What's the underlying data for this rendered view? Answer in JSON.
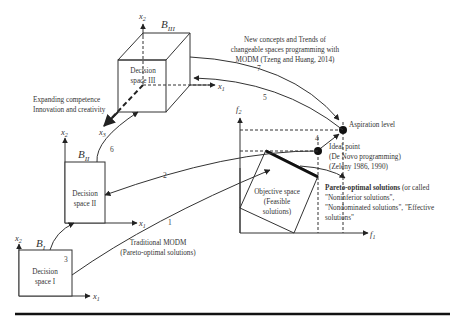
{
  "decision_spaces": {
    "space1": {
      "label_line1": "Decision",
      "label_line2": "space I",
      "b_label": "B",
      "b_sub": "I"
    },
    "space2": {
      "label_line1": "Decision",
      "label_line2": "space II",
      "b_label": "B",
      "b_sub": "II"
    },
    "space3": {
      "label_line1": "Decision",
      "label_line2": "space III",
      "b_label": "B",
      "b_sub": "III"
    }
  },
  "axes": {
    "x1": "x",
    "x1_sub": "1",
    "x2": "x",
    "x2_sub": "2",
    "x3": "x",
    "x3_sub": "3",
    "f1": "f",
    "f1_sub": "1",
    "f2": "f",
    "f2_sub": "2"
  },
  "objective_space": {
    "line1": "Objective space",
    "line2": "(Feasible",
    "line3": "solutions)"
  },
  "annotations": {
    "expanding": {
      "line1": "Expanding competence",
      "line2": "Innovation and creativity"
    },
    "new_concepts": {
      "line1": "New concepts and Trends of",
      "line2": "changeable spaces programming with",
      "line3": "MODM (Tzeng and Huang, 2014)"
    },
    "traditional": {
      "line1": "Traditional MODM",
      "line2": "(Pareto-optimal solutions)"
    },
    "aspiration": "Aspiration level",
    "ideal": {
      "line1": "Ideal point",
      "line2": "(De Novo programming)",
      "line3": "(Zeleny 1986, 1990)"
    },
    "pareto": {
      "bold": "Pareto-optimal solutions",
      "rest1": " (or called",
      "line2": "\"Noninferior solutions\",",
      "line3": "\"Nondominated solutions\", \"Effective",
      "line4": "solutions\""
    }
  },
  "path_numbers": {
    "n1": "1",
    "n2": "2",
    "n3": "3",
    "n4": "4",
    "n5": "5",
    "n6": "6",
    "n7": "7"
  }
}
